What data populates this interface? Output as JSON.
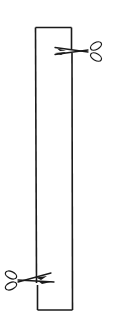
{
  "diagram": {
    "strip": {
      "x": 35,
      "y": 27,
      "width": 37,
      "height": 283,
      "stroke": "#1a1a1a"
    },
    "cuts": [
      {
        "position": "top-right",
        "edge": "right",
        "y": 50,
        "icon": "scissors-icon",
        "direction": "left"
      },
      {
        "position": "bottom-left",
        "edge": "left",
        "y": 280,
        "icon": "scissors-icon",
        "direction": "right"
      }
    ],
    "colors": {
      "line": "#1a1a1a",
      "background": "#ffffff"
    }
  }
}
